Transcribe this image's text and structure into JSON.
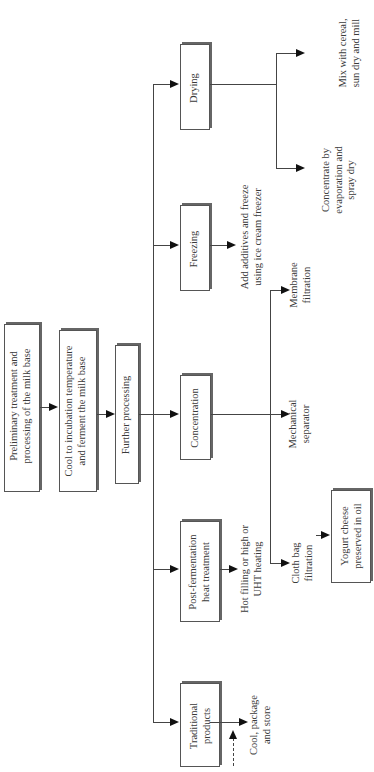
{
  "diagram": {
    "type": "flowchart",
    "orientation": "rotated -90deg (reads bottom-to-top)",
    "main_steps": [
      {
        "id": "preliminary",
        "label_lines": [
          "Preliminary treatment and",
          "processing of the milk base"
        ]
      },
      {
        "id": "cool",
        "label_lines": [
          "Cool to incubation temperature",
          "and ferment the milk base"
        ]
      },
      {
        "id": "further",
        "label_lines": [
          "Further processing"
        ]
      }
    ],
    "branches": [
      {
        "id": "traditional",
        "label_lines": [
          "Traditional",
          "products"
        ],
        "outputs": [
          {
            "label_lines": [
              "Cool, package",
              "and store"
            ]
          }
        ]
      },
      {
        "id": "postferm",
        "label_lines": [
          "Post-fermentation",
          "heat treatment"
        ],
        "outputs": [
          {
            "label_lines": [
              "Hot filling or high or",
              "UHT heating"
            ]
          }
        ]
      },
      {
        "id": "concentration",
        "label_lines": [
          "Concentration"
        ],
        "outputs": [
          {
            "label_lines": [
              "Cloth bag",
              "filtration"
            ]
          },
          {
            "label_lines": [
              "Mechanical",
              "separator"
            ]
          },
          {
            "label_lines": [
              "Membrane",
              "filtration"
            ]
          }
        ]
      },
      {
        "id": "freezing",
        "label_lines": [
          "Freezing"
        ],
        "outputs": [
          {
            "label_lines": [
              "Add additives and freeze",
              "using ice cream freezer"
            ]
          }
        ]
      },
      {
        "id": "drying",
        "label_lines": [
          "Drying"
        ],
        "outputs": [
          {
            "label_lines": [
              "Concentrate by",
              "evaporation and",
              "spray dry"
            ]
          },
          {
            "label_lines": [
              "Mix with cereal,",
              "sun dry and mill"
            ]
          }
        ]
      }
    ],
    "final_product": {
      "label_lines": [
        "Yogurt cheese",
        "preserved in oil"
      ]
    }
  }
}
